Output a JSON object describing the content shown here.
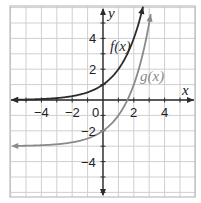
{
  "chart_data": {
    "type": "line",
    "title": "",
    "xlabel": "x",
    "ylabel": "y",
    "xlim": [
      -6,
      6
    ],
    "ylim": [
      -6.3,
      6.1
    ],
    "grid": true,
    "x_ticks": [
      -4,
      -2,
      2,
      4
    ],
    "x_tick_labels": [
      "−4",
      "−2",
      "2",
      "4"
    ],
    "y_ticks": [
      4,
      2,
      -2,
      -4
    ],
    "y_tick_labels": [
      "4",
      "2",
      "−2",
      "−4"
    ],
    "origin_label": "0",
    "series": [
      {
        "name": "f(x)",
        "label": "f(x)",
        "expression": "2^x",
        "color": "#2b2b2b",
        "points": [
          [
            -6,
            0.016
          ],
          [
            -4,
            0.0625
          ],
          [
            -2,
            0.25
          ],
          [
            -1,
            0.5
          ],
          [
            0,
            1
          ],
          [
            1,
            2
          ],
          [
            2,
            4
          ],
          [
            2.6,
            6.06
          ]
        ],
        "horizontal_asymptote": 0
      },
      {
        "name": "g(x)",
        "label": "g(x)",
        "expression": "2^x - 3",
        "color": "#8a8a8a",
        "points": [
          [
            -6,
            -2.98
          ],
          [
            -4,
            -2.94
          ],
          [
            -2,
            -2.75
          ],
          [
            -1,
            -2.5
          ],
          [
            0,
            -2
          ],
          [
            1,
            -1
          ],
          [
            1.58,
            0
          ],
          [
            2,
            1
          ],
          [
            3,
            5
          ],
          [
            3.1,
            5.57
          ]
        ],
        "horizontal_asymptote": -3
      }
    ],
    "legend": "inline labels near curves"
  }
}
